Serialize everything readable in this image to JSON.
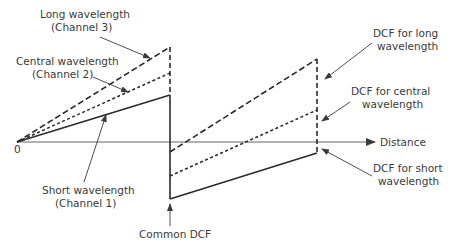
{
  "diagram": {
    "axis": {
      "origin_label": "0",
      "x_label": "Distance"
    },
    "series": [
      {
        "name": "Long wavelength (Channel 3)",
        "style": "dashed"
      },
      {
        "name": "Central wavelength (Channel 2)",
        "style": "dotted"
      },
      {
        "name": "Short wavelength (Channel 1)",
        "style": "solid"
      }
    ],
    "labels": {
      "long_line1": "Long wavelength",
      "long_line2": "(Channel 3)",
      "central_line1": "Central wavelength",
      "central_line2": "(Channel 2)",
      "short_line1": "Short wavelength",
      "short_line2": "(Channel 1)",
      "common_dcf": "Common DCF",
      "dcf_long_line1": "DCF for long",
      "dcf_long_line2": "wavelength",
      "dcf_central_line1": "DCF for central",
      "dcf_central_line2": "wavelength",
      "dcf_short_line1": "DCF for short",
      "dcf_short_line2": "wavelength"
    },
    "colors": {
      "line": "#2a2a2a",
      "axis": "#555555",
      "text": "#3a3a3a"
    }
  }
}
